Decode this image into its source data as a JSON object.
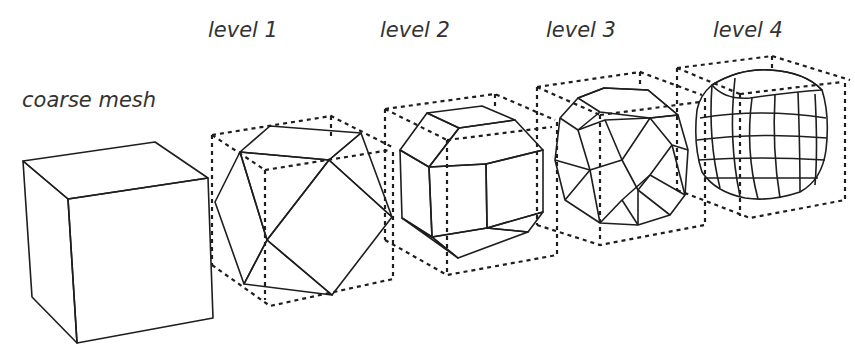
{
  "figure": {
    "title_cut_off": "…ively refining the quadrilateral mesh…",
    "labels": {
      "coarse": "coarse mesh",
      "level1": "level 1",
      "level2": "level 2",
      "level3": "level 3",
      "level4": "level 4"
    },
    "colors": {
      "face_light": "#b3b3b3",
      "face_mid": "#a4a4a4",
      "face_dark": "#969696",
      "edge": "#1e1e1e",
      "text": "#333333"
    }
  }
}
